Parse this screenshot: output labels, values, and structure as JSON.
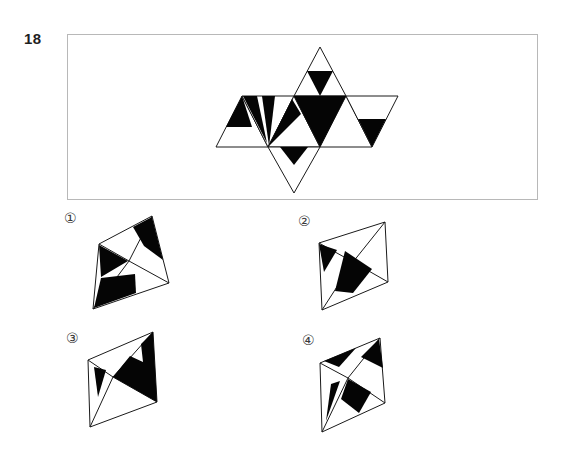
{
  "question": {
    "number": "18"
  },
  "options": [
    {
      "label": "①"
    },
    {
      "label": "②"
    },
    {
      "label": "③"
    },
    {
      "label": "④"
    }
  ],
  "colors": {
    "ink": "#1a1a1a",
    "shape_fill": "#050505",
    "box_border": "#b8b8b8",
    "background": "#ffffff"
  }
}
